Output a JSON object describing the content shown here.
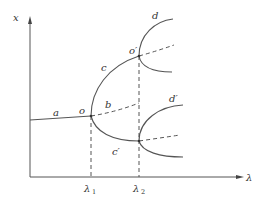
{
  "diagram": {
    "type": "bifurcation-diagram",
    "axes": {
      "y_label": "x",
      "x_label": "λ"
    },
    "ticks": [
      {
        "symbol": "λ",
        "sub": "1"
      },
      {
        "symbol": "λ",
        "sub": "2"
      }
    ],
    "branch_labels": {
      "a": "a",
      "o": "o",
      "b": "b",
      "c": "c",
      "c_prime": "c′",
      "o_prime": "o′",
      "d": "d",
      "d_prime": "d′"
    },
    "legend_styles": {
      "stable": "solid",
      "unstable": "dashed"
    },
    "colors": {
      "line": "#555555",
      "text": "#333333",
      "background": "#ffffff"
    }
  }
}
